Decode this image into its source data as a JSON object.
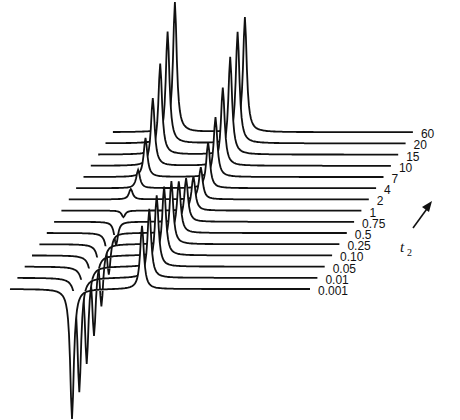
{
  "chart_data": {
    "type": "stacked-line",
    "title": "",
    "axis_label": "t",
    "axis_subscript": "2",
    "axis_arrow": "up-right (increasing t2 toward back)",
    "traces": [
      {
        "label": "0.001",
        "peak1": -1.0,
        "peak2": 0.55
      },
      {
        "label": "0.01",
        "peak1": -0.88,
        "peak2": 0.6
      },
      {
        "label": "0.05",
        "peak1": -0.75,
        "peak2": 0.62
      },
      {
        "label": "0.10",
        "peak1": -0.62,
        "peak2": 0.6
      },
      {
        "label": "0.25",
        "peak1": -0.48,
        "peak2": 0.55
      },
      {
        "label": "0.5",
        "peak1": -0.32,
        "peak2": 0.45
      },
      {
        "label": "0.75",
        "peak1": -0.18,
        "peak2": 0.38
      },
      {
        "label": "1",
        "peak1": -0.05,
        "peak2": 0.3
      },
      {
        "label": "2",
        "peak1": 0.08,
        "peak2": 0.28
      },
      {
        "label": "4",
        "peak1": 0.14,
        "peak2": 0.4
      },
      {
        "label": "7",
        "peak1": 0.3,
        "peak2": 0.52
      },
      {
        "label": "10",
        "peak1": 0.52,
        "peak2": 0.68
      },
      {
        "label": "15",
        "peak1": 0.7,
        "peak2": 0.85
      },
      {
        "label": "20",
        "peak1": 0.86,
        "peak2": 0.97
      },
      {
        "label": "60",
        "peak1": 1.0,
        "peak2": 1.0
      }
    ],
    "x_ticks": [],
    "grid": false,
    "legend": "labels at right end of each trace"
  },
  "labels": {
    "axis": "t",
    "axis_sub": "2"
  }
}
